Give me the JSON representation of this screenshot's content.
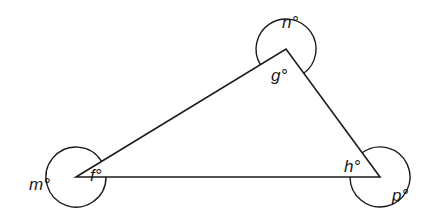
{
  "diagram": {
    "type": "triangle-with-reflex-angles",
    "vertices": {
      "F": {
        "x": 76,
        "y": 177
      },
      "G": {
        "x": 286,
        "y": 49
      },
      "H": {
        "x": 380,
        "y": 177
      }
    },
    "interior_angles": {
      "f": "f°",
      "g": "g°",
      "h": "h°"
    },
    "reflex_angles": {
      "m": "m°",
      "n": "n°",
      "p": "p°"
    },
    "stroke_color": "#1a1a1a",
    "background_color": "#ffffff"
  }
}
